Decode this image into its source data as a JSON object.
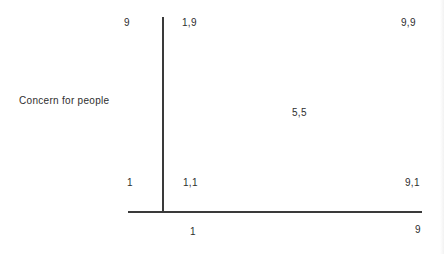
{
  "grid": {
    "y_axis_label": "Concern for people",
    "y_ticks": {
      "top": "9",
      "bottom": "1"
    },
    "x_ticks": {
      "left": "1",
      "right": "9"
    },
    "points": {
      "top_left": "1,9",
      "top_right": "9,9",
      "center": "5,5",
      "bottom_left": "1,1",
      "bottom_right": "9,1"
    }
  }
}
